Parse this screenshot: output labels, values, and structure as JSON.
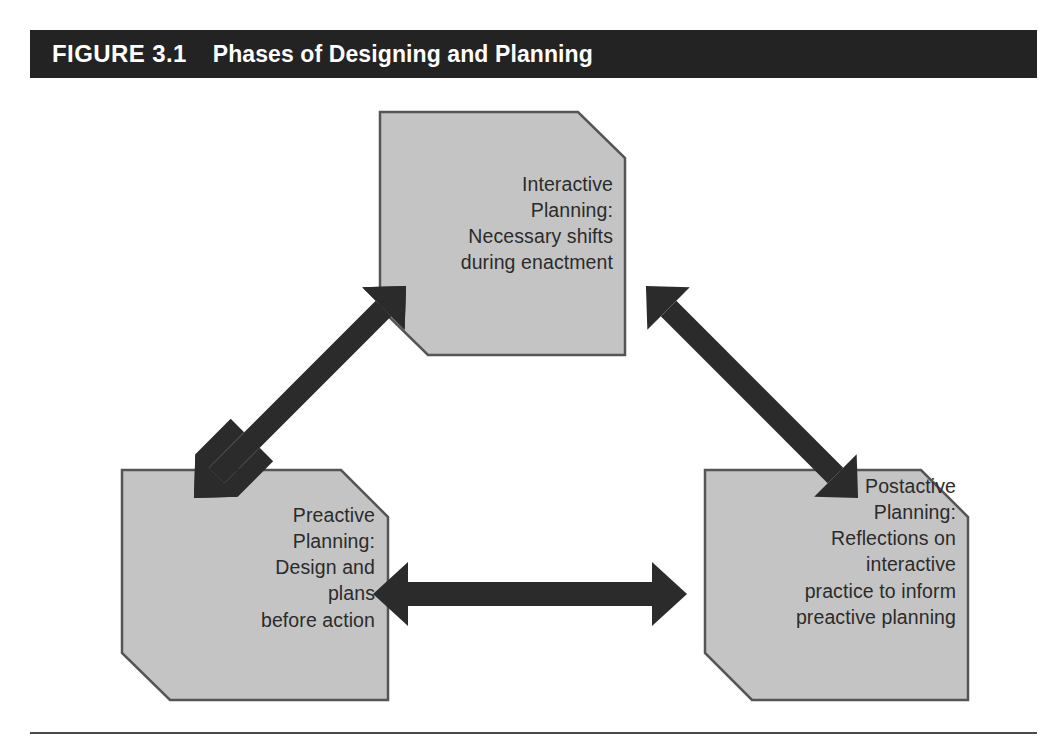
{
  "figure": {
    "label": "FIGURE 3.1",
    "title": "Phases of Designing and Planning",
    "title_bar_color": "#232323",
    "title_text_color": "#ffffff",
    "node_fill_color": "#c4c4c4",
    "node_border_color": "#555555",
    "arrow_color": "#2b2b2b",
    "rule_color": "#4a4a4a"
  },
  "nodes": [
    {
      "id": "interactive",
      "name": "interactive-planning-node",
      "heading": "Interactive Planning:",
      "body": "Necessary shifts during enactment",
      "text": "Interactive\nPlanning:\nNecessary shifts\nduring enactment"
    },
    {
      "id": "preactive",
      "name": "preactive-planning-node",
      "heading": "Preactive Planning:",
      "body": "Design and plans before action",
      "text": "Preactive\nPlanning:\nDesign and\nplans\nbefore action"
    },
    {
      "id": "postactive",
      "name": "postactive-planning-node",
      "heading": "Postactive Planning:",
      "body": "Reflections on interactive practice to inform preactive planning",
      "text": "Postactive\nPlanning:\nReflections on\ninteractive\npractice to inform\npreactive planning"
    }
  ],
  "connectors": [
    {
      "id": "preactive-interactive",
      "name": "arrow-preactive-interactive",
      "from": "preactive",
      "to": "interactive",
      "style": "double-headed",
      "orientation": "diagonal-up-right"
    },
    {
      "id": "interactive-postactive",
      "name": "arrow-interactive-postactive",
      "from": "interactive",
      "to": "postactive",
      "style": "double-headed",
      "orientation": "diagonal-down-right"
    },
    {
      "id": "preactive-postactive",
      "name": "arrow-preactive-postactive",
      "from": "preactive",
      "to": "postactive",
      "style": "double-headed",
      "orientation": "horizontal"
    }
  ]
}
